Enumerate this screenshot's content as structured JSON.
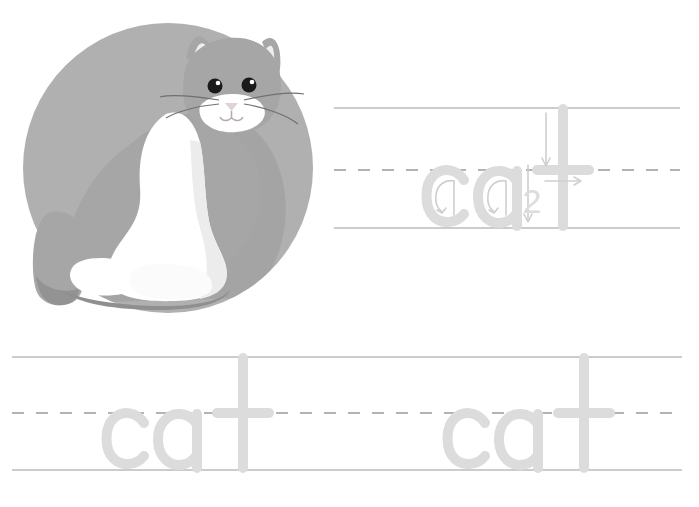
{
  "worksheet": {
    "title": "cat handwriting tracing worksheet",
    "background_color": "#ffffff",
    "word": "cat",
    "letters": [
      "c",
      "a",
      "t"
    ]
  },
  "illustration": {
    "name": "cat-illustration",
    "subject": "cat",
    "circle_color": "#b0b0b0",
    "circle_shadow_color": "#9a9a9a",
    "body_gray": "#a6a6a6",
    "body_gray_dark": "#8f8f8f",
    "body_white": "#ffffff",
    "body_white_shadow": "#ececec",
    "ear_inner_color": "#f2eded",
    "eye_color": "#1a1a1a",
    "nose_color": "#e0d3d3",
    "whisker_color": "#707070"
  },
  "guidelines": {
    "solid_color": "#9a9a9a",
    "dashed_color": "#9a9a9a",
    "dash_pattern": "12 12"
  },
  "trace": {
    "letter_color": "#dcdcdc",
    "arrow_color": "#d2d2d2",
    "number_color": "#d8d8d8"
  },
  "rows": [
    {
      "name": "row-top",
      "word": "cat",
      "has_stroke_guides": true,
      "stroke_numbers": [
        "2"
      ],
      "arrows": [
        {
          "name": "c-stroke-arrow",
          "letter": "c",
          "direction": "counterclockwise-curve"
        },
        {
          "name": "a-bowl-arrow",
          "letter": "a",
          "direction": "counterclockwise-curve"
        },
        {
          "name": "a-stem-arrow",
          "letter": "a",
          "direction": "down"
        },
        {
          "name": "t-stem-arrow",
          "letter": "t",
          "direction": "down",
          "number": "1"
        },
        {
          "name": "t-crossbar-arrow",
          "letter": "t",
          "direction": "right",
          "number": "2"
        }
      ]
    },
    {
      "name": "row-bottom-left",
      "word": "cat",
      "has_stroke_guides": false
    },
    {
      "name": "row-bottom-right",
      "word": "cat",
      "has_stroke_guides": false
    }
  ]
}
